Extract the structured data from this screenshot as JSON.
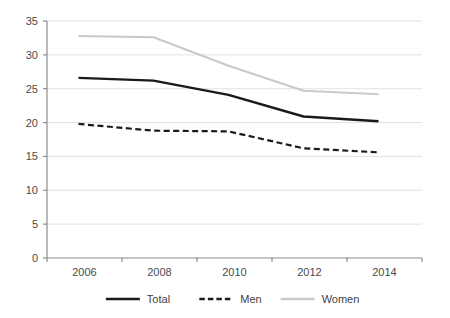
{
  "chart_data": {
    "type": "line",
    "title": "",
    "subtitle": "",
    "xlabel": "",
    "ylabel": "",
    "categories": [
      "2006",
      "2008",
      "2010",
      "2012",
      "2014"
    ],
    "x": [
      2006,
      2008,
      2010,
      2012,
      2014
    ],
    "xlim": [
      2005,
      2015
    ],
    "ylim": [
      0,
      35
    ],
    "yticks": [
      "0",
      "5",
      "10",
      "15",
      "20",
      "25",
      "30",
      "35"
    ],
    "ytick_values": [
      0,
      5,
      10,
      15,
      20,
      25,
      30,
      35
    ],
    "grid": "horizontal",
    "legend_position": "bottom",
    "series": [
      {
        "name": "Total",
        "values": [
          26.6,
          26.2,
          24.1,
          20.9,
          20.2
        ],
        "color": "#1a1a1a",
        "style": "solid",
        "width": 2.4
      },
      {
        "name": "Men",
        "values": [
          19.8,
          18.8,
          18.7,
          16.2,
          15.6
        ],
        "color": "#1a1a1a",
        "style": "dashed",
        "width": 2.2
      },
      {
        "name": "Women",
        "values": [
          32.8,
          32.6,
          28.4,
          24.7,
          24.2
        ],
        "color": "#c9c9c9",
        "style": "solid",
        "width": 2.0
      }
    ]
  },
  "axes": {
    "y_tick_labels": [
      "35",
      "30",
      "25",
      "20",
      "15",
      "10",
      "5",
      "0"
    ],
    "x_tick_labels": [
      "2006",
      "2008",
      "2010",
      "2012",
      "2014"
    ],
    "axis_color": "#8c8c8c",
    "grid_color": "#e2e2e2"
  },
  "legend": {
    "items": [
      {
        "label": "Total",
        "color": "#1a1a1a",
        "style": "solid"
      },
      {
        "label": "Men",
        "color": "#1a1a1a",
        "style": "dashed"
      },
      {
        "label": "Women",
        "color": "#c9c9c9",
        "style": "solid"
      }
    ]
  }
}
